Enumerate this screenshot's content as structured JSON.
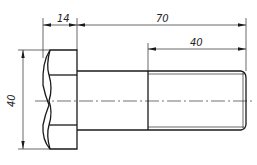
{
  "drawing": {
    "title": "Hex bolt technical drawing",
    "dimensions": {
      "head_length": "14",
      "bolt_length": "70",
      "thread_length": "40",
      "head_height": "40"
    },
    "colors": {
      "line": "#1a1a1a",
      "background": "#ffffff"
    }
  }
}
